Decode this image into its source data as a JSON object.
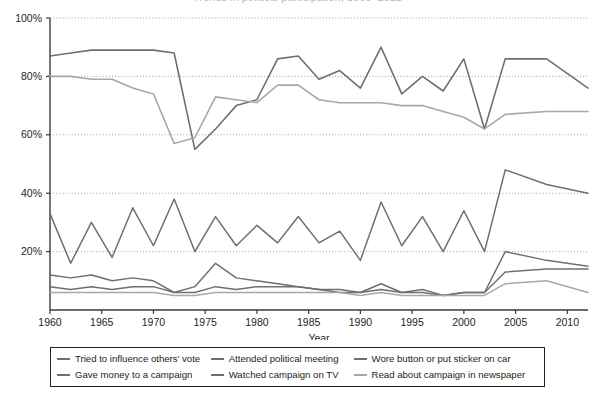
{
  "title": {
    "text": "Trends in political participation, 1960–2012",
    "cropped": true
  },
  "axes": {
    "x_title": "Year",
    "y_ticks": [
      "0%",
      "20%",
      "40%",
      "60%",
      "80%",
      "100%"
    ],
    "x_ticks": [
      "1960",
      "1965",
      "1970",
      "1975",
      "1980",
      "1985",
      "1990",
      "1995",
      "2000",
      "2005",
      "2010"
    ]
  },
  "legend": {
    "items": [
      {
        "label": "Tried to influence others’ vote",
        "color": "#6f6f6f"
      },
      {
        "label": "Attended political meeting",
        "color": "#6f6f6f"
      },
      {
        "label": "Wore button or put sticker on car",
        "color": "#6f6f6f"
      },
      {
        "label": "Gave money to a campaign",
        "color": "#6f6f6f"
      },
      {
        "label": "Watched campaign on TV",
        "color": "#6f6f6f"
      },
      {
        "label": "Read about campaign in newspaper",
        "color": "#a8a8a8"
      }
    ]
  },
  "chart_data": {
    "type": "line",
    "title": "Trends in political participation, 1960–2012",
    "xlabel": "Year",
    "ylabel": "",
    "xlim": [
      1960,
      2012
    ],
    "ylim": [
      0,
      100
    ],
    "grid": "horizontal-dotted",
    "legend_position": "below",
    "x": [
      1960,
      1962,
      1964,
      1966,
      1968,
      1970,
      1972,
      1974,
      1976,
      1978,
      1980,
      1982,
      1984,
      1986,
      1988,
      1990,
      1992,
      1994,
      1996,
      1998,
      2000,
      2002,
      2004,
      2008,
      2012
    ],
    "series": [
      {
        "name": "Watched campaign on TV",
        "color": "#6f6f6f",
        "width": 1.6,
        "values": [
          87,
          88,
          89,
          89,
          89,
          89,
          88,
          55,
          62,
          70,
          72,
          86,
          87,
          79,
          82,
          76,
          90,
          74,
          80,
          75,
          86,
          62,
          86,
          86,
          76
        ]
      },
      {
        "name": "Read about campaign in newspaper",
        "color": "#a8a8a8",
        "width": 1.6,
        "values": [
          80,
          80,
          79,
          79,
          76,
          74,
          57,
          59,
          73,
          72,
          71,
          77,
          77,
          72,
          71,
          71,
          71,
          70,
          70,
          68,
          66,
          62,
          67,
          68,
          68
        ]
      },
      {
        "name": "Wore button or put sticker on car",
        "color": "#6f6f6f",
        "width": 1.5,
        "values": [
          33,
          16,
          30,
          18,
          35,
          22,
          38,
          20,
          32,
          22,
          29,
          23,
          32,
          23,
          27,
          17,
          37,
          22,
          32,
          20,
          34,
          20,
          48,
          43,
          40
        ]
      },
      {
        "name": "Tried to influence others’ vote",
        "color": "#6f6f6f",
        "width": 1.5,
        "values": [
          12,
          11,
          12,
          10,
          11,
          10,
          6,
          8,
          16,
          11,
          10,
          9,
          8,
          7,
          6,
          6,
          9,
          6,
          7,
          5,
          6,
          6,
          13,
          14,
          14
        ]
      },
      {
        "name": "Attended political meeting",
        "color": "#6f6f6f",
        "width": 1.5,
        "values": [
          8,
          7,
          8,
          7,
          8,
          8,
          6,
          6,
          8,
          7,
          8,
          8,
          8,
          7,
          7,
          6,
          7,
          6,
          6,
          5,
          6,
          6,
          20,
          17,
          15
        ]
      },
      {
        "name": "Gave money to a campaign",
        "color": "#a8a8a8",
        "width": 1.5,
        "values": [
          6,
          6,
          6,
          6,
          6,
          6,
          5,
          5,
          6,
          6,
          6,
          6,
          6,
          6,
          6,
          5,
          6,
          5,
          5,
          5,
          5,
          5,
          9,
          10,
          6
        ]
      }
    ]
  }
}
